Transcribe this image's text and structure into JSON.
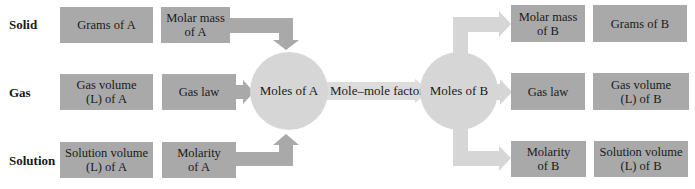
{
  "diagram": {
    "colors": {
      "box": "#a9a9a9",
      "node": "#d6d6d6",
      "light_arrow": "#d6d6d6",
      "dark_arrow": "#a9a9a9",
      "text": "#1a1a1a"
    },
    "row_labels": [
      "Solid",
      "Gas",
      "Solution"
    ],
    "left": {
      "rows": [
        {
          "quantity": "Grams of A",
          "factor": "Molar mass\nof A"
        },
        {
          "quantity": "Gas volume\n(L) of A",
          "factor": "Gas law"
        },
        {
          "quantity": "Solution volume\n(L) of A",
          "factor": "Molarity\nof A"
        }
      ]
    },
    "center": {
      "node_a": "Moles of A",
      "link": "Mole–mole factor",
      "node_b": "Moles of B"
    },
    "right": {
      "rows": [
        {
          "factor": "Molar mass\nof B",
          "quantity": "Grams of B"
        },
        {
          "factor": "Gas law",
          "quantity": "Gas volume\n(L) of B"
        },
        {
          "factor": "Molarity\nof B",
          "quantity": "Solution volume\n(L) of B"
        }
      ]
    }
  }
}
